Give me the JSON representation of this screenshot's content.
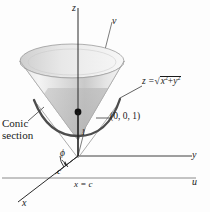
{
  "figure": {
    "background_color": "#fdfdfd",
    "ink_color": "#1a1a1a",
    "cone_fill_light": "#f2f2f2",
    "cone_fill_mid": "#d8d8d8",
    "cone_fill_dark": "#b9b9b9",
    "curve_color": "#4a4a4a"
  },
  "axes": {
    "z_label": "z",
    "y_label": "y",
    "x_label": "x",
    "v_label": "v",
    "u_label": "u"
  },
  "labels": {
    "equation_lhs": "z =",
    "equation_radicand_x": "x",
    "equation_exp_x": "2",
    "equation_plus": "+",
    "equation_radicand_y": "y",
    "equation_exp_y": "2",
    "equation_radical": "√",
    "point": "(0, 0, 1)",
    "conic_line1": "Conic",
    "conic_line2": "section",
    "height_one": "1",
    "phi": "ϕ",
    "c_label": "c",
    "plane_equation": "x = c"
  }
}
